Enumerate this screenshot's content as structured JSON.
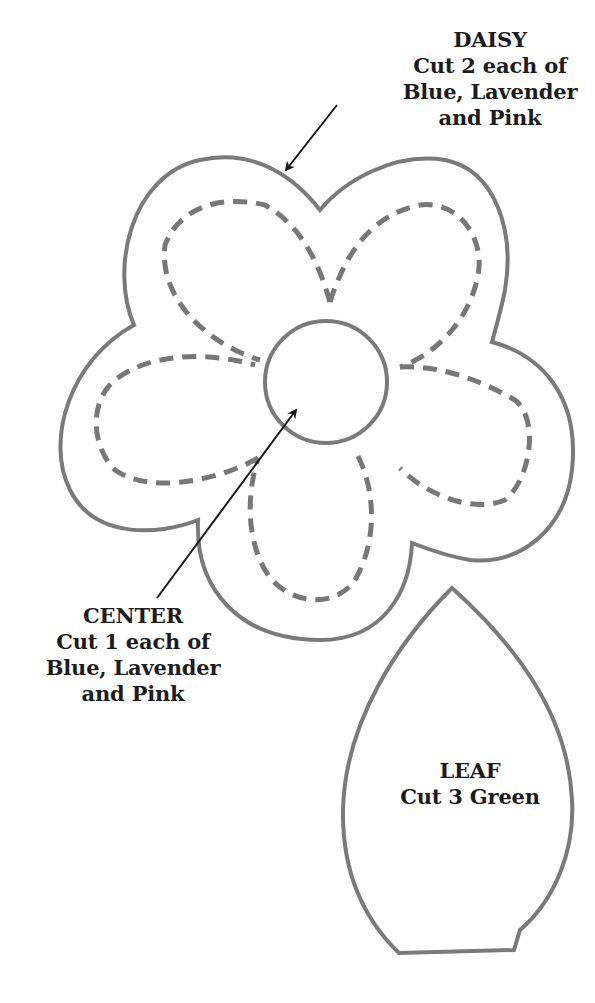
{
  "pattern": {
    "daisy": {
      "title": "DAISY",
      "lines": [
        "Cut 2 each of",
        "Blue, Lavender",
        "and Pink"
      ]
    },
    "center": {
      "title": "CENTER",
      "lines": [
        "Cut 1 each of",
        "Blue, Lavender",
        "and Pink"
      ]
    },
    "leaf": {
      "title": "LEAF",
      "lines": [
        "Cut 3 Green"
      ]
    }
  },
  "colors": {
    "outline": "#7a7a7a",
    "dashed": "#777777",
    "arrow": "#1a1a1a",
    "text": "#1c1c1c"
  }
}
